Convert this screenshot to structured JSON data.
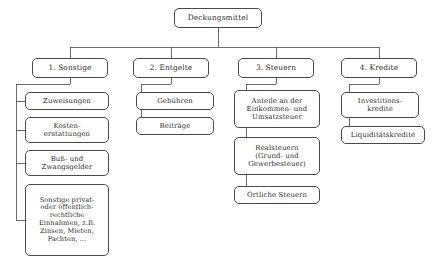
{
  "diagram": {
    "title": "Deckungsmittel",
    "root": {
      "label": "Deckungsmittel",
      "x": 174,
      "y": 8,
      "w": 88,
      "h": 20
    },
    "branches": [
      {
        "label": "1. Sonstige",
        "x": 32,
        "y": 58,
        "w": 76,
        "h": 20,
        "children": [
          {
            "label": "Zuweisungen",
            "x": 25,
            "y": 92,
            "w": 84,
            "h": 18
          },
          {
            "label": "Kosten-\nerstattungen",
            "x": 25,
            "y": 117,
            "w": 84,
            "h": 26
          },
          {
            "label": "Buß- und\nZwangsgelder",
            "x": 25,
            "y": 150,
            "w": 84,
            "h": 26
          },
          {
            "label": "Sonstige privat-\noder öffentlich-\nrechtliche\nEinnahmen, z.B.\nZinsen, Mieten,\nPachten, ...",
            "x": 25,
            "y": 184,
            "w": 84,
            "h": 72
          }
        ]
      },
      {
        "label": "2. Entgelte",
        "x": 133,
        "y": 58,
        "w": 76,
        "h": 20,
        "children": [
          {
            "label": "Gebühren",
            "x": 136,
            "y": 92,
            "w": 78,
            "h": 18
          },
          {
            "label": "Beiträge",
            "x": 136,
            "y": 117,
            "w": 78,
            "h": 18
          }
        ]
      },
      {
        "label": "3. Steuern",
        "x": 238,
        "y": 58,
        "w": 76,
        "h": 20,
        "children": [
          {
            "label": "Anteile an der\nEinkommen- und\nUmsatzsteuer",
            "x": 234,
            "y": 90,
            "w": 86,
            "h": 38
          },
          {
            "label": "Realsteuern\n(Grund- und\nGewerbesteuer)",
            "x": 234,
            "y": 137,
            "w": 86,
            "h": 38
          },
          {
            "label": "Örtliche Steuern",
            "x": 234,
            "y": 186,
            "w": 86,
            "h": 18
          }
        ]
      },
      {
        "label": "4. Kredite",
        "x": 341,
        "y": 58,
        "w": 76,
        "h": 20,
        "children": [
          {
            "label": "Investitions-\nkredite",
            "x": 341,
            "y": 92,
            "w": 78,
            "h": 26
          },
          {
            "label": "Liquiditätskredite",
            "x": 341,
            "y": 126,
            "w": 84,
            "h": 18
          }
        ]
      }
    ],
    "style": {
      "line_color": "#4a4a4a",
      "text_color": "#2b2b2b",
      "background": "#ffffff"
    }
  }
}
